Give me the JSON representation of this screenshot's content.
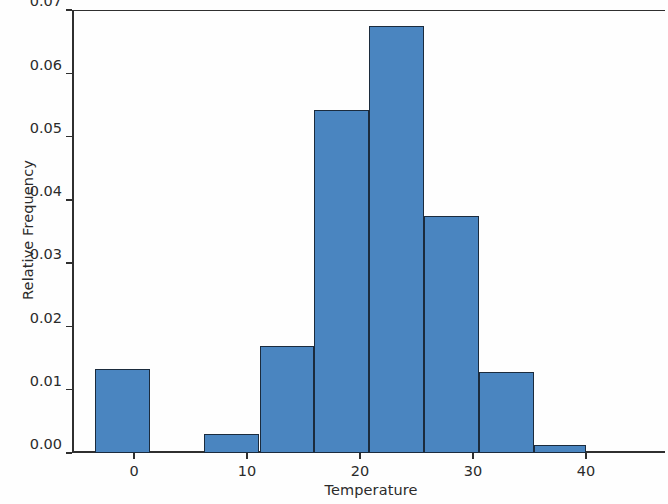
{
  "chart_data": {
    "type": "bar",
    "title": "",
    "xlabel": "Temperature",
    "ylabel": "Relative Frequency",
    "xlim": [
      -5.5,
      47
    ],
    "ylim": [
      0.0,
      0.07
    ],
    "grid": false,
    "legend": null,
    "bin_edges": [
      -3.5,
      1.4,
      6.2,
      11.1,
      15.9,
      20.8,
      25.7,
      30.5,
      35.4,
      40.0
    ],
    "categories": [
      "-3.5 to 1.4",
      "1.4 to 6.2",
      "6.2 to 11.1",
      "11.1 to 15.9",
      "15.9 to 20.8",
      "20.8 to 25.7",
      "25.7 to 30.5",
      "30.5 to 35.4",
      "35.4 to 40.0"
    ],
    "values": [
      0.0133,
      0.0,
      0.003,
      0.0169,
      0.0542,
      0.0675,
      0.0375,
      0.0128,
      0.0012
    ],
    "xticks": [
      0,
      10,
      20,
      30,
      40
    ],
    "xticklabels": [
      "0",
      "10",
      "20",
      "30",
      "40"
    ],
    "yticks": [
      0.0,
      0.01,
      0.02,
      0.03,
      0.04,
      0.05,
      0.06,
      0.07
    ],
    "yticklabels": [
      "0.00",
      "0.01",
      "0.02",
      "0.03",
      "0.04",
      "0.05",
      "0.06",
      "0.07"
    ],
    "bar_color": "#4a85c0",
    "bar_edge_color": "#1b2b3d"
  }
}
